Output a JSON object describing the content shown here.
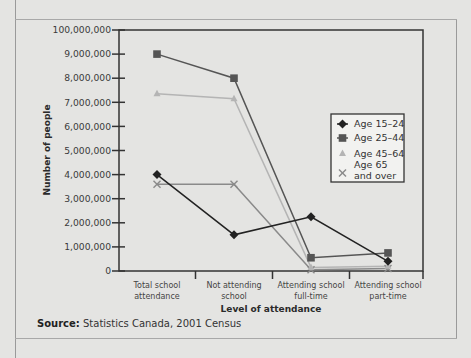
{
  "chart_data": {
    "type": "line",
    "title": "",
    "xlabel": "Level of attendance",
    "ylabel": "Number of people",
    "ylim": [
      0,
      10000000
    ],
    "y_ticks": [
      "0",
      "1,000,000",
      "2,000,000",
      "3,000,000",
      "4,000,000",
      "5,000,000",
      "6,000,000",
      "7,000,000",
      "8,000,000",
      "9,000,000",
      "100,000,000"
    ],
    "categories": [
      [
        "Total school",
        "attendance"
      ],
      [
        "Not attending",
        "school"
      ],
      [
        "Attending school",
        "full-time"
      ],
      [
        "Attending school",
        "part-time"
      ]
    ],
    "series": [
      {
        "name": "Age 15–24",
        "marker": "diamond",
        "color": "#222222",
        "values": [
          4000000,
          1500000,
          2250000,
          400000
        ]
      },
      {
        "name": "Age 25–44",
        "marker": "square",
        "color": "#555555",
        "values": [
          9000000,
          8000000,
          550000,
          750000
        ]
      },
      {
        "name": "Age 45–64",
        "marker": "triangle",
        "color": "#b4b4b4",
        "values": [
          7350000,
          7150000,
          150000,
          200000
        ]
      },
      {
        "name": "Age 65 and over",
        "marker": "x",
        "color": "#8a8a8a",
        "values": [
          3600000,
          3600000,
          50000,
          100000
        ]
      }
    ],
    "legend": {
      "position": "right-inside",
      "entries": [
        [
          "Age 15–24"
        ],
        [
          "Age 25–44"
        ],
        [
          "Age 45–64"
        ],
        [
          "Age 65",
          "and over"
        ]
      ]
    },
    "grid": false
  },
  "source": {
    "label": "Source:",
    "text": " Statistics Canada, 2001 Census"
  }
}
